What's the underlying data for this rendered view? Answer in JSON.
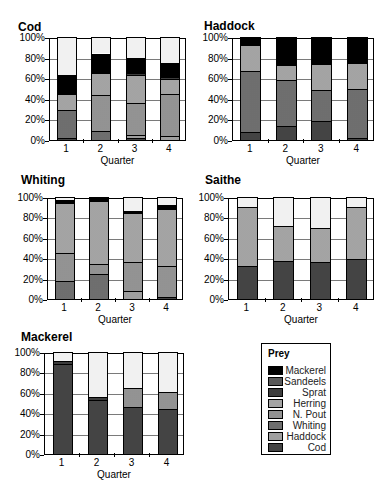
{
  "legend": {
    "title": "Prey",
    "items": [
      {
        "label": "Mackerel",
        "key": "mackerel"
      },
      {
        "label": "Sandeels",
        "key": "sandeels"
      },
      {
        "label": "Sprat",
        "key": "sprat"
      },
      {
        "label": "Herring",
        "key": "herring"
      },
      {
        "label": "N. Pout",
        "key": "npout"
      },
      {
        "label": "Whiting",
        "key": "whiting"
      },
      {
        "label": "Haddock",
        "key": "haddock"
      },
      {
        "label": "Cod",
        "key": "cod"
      }
    ]
  },
  "chart_data": [
    {
      "type": "bar",
      "stacked": true,
      "title": "Cod",
      "xlabel": "Quarter",
      "ylabel": "",
      "categories": [
        "1",
        "2",
        "3",
        "4"
      ],
      "yticks": [
        "0%",
        "20%",
        "40%",
        "60%",
        "80%",
        "100%"
      ],
      "ylim": [
        0,
        100
      ],
      "grid": true,
      "series": [
        {
          "name": "Cod",
          "values": [
            2,
            0,
            2,
            0
          ]
        },
        {
          "name": "Haddock",
          "values": [
            0,
            0,
            3,
            4
          ]
        },
        {
          "name": "Whiting",
          "values": [
            27,
            9,
            0,
            0
          ]
        },
        {
          "name": "N. Pout",
          "values": [
            0,
            35,
            31,
            41
          ]
        },
        {
          "name": "Herring",
          "values": [
            16,
            21,
            27,
            14
          ]
        },
        {
          "name": "Sprat",
          "values": [
            0,
            0,
            2,
            2
          ]
        },
        {
          "name": "Sandeels",
          "values": [
            0,
            0,
            0,
            0
          ]
        },
        {
          "name": "Mackerel",
          "values": [
            18,
            19,
            15,
            14
          ]
        },
        {
          "name": "Other",
          "values": [
            37,
            16,
            20,
            25
          ]
        }
      ]
    },
    {
      "type": "bar",
      "stacked": true,
      "title": "Haddock",
      "xlabel": "Quarter",
      "ylabel": "",
      "categories": [
        "1",
        "2",
        "3",
        "4"
      ],
      "yticks": [
        "0%",
        "20%",
        "40%",
        "60%",
        "80%",
        "100%"
      ],
      "ylim": [
        0,
        100
      ],
      "grid": true,
      "series": [
        {
          "name": "Cod",
          "values": [
            8,
            14,
            18,
            2
          ]
        },
        {
          "name": "Haddock",
          "values": [
            0,
            0,
            0,
            0
          ]
        },
        {
          "name": "Whiting",
          "values": [
            59,
            44,
            31,
            48
          ]
        },
        {
          "name": "N. Pout",
          "values": [
            0,
            0,
            0,
            0
          ]
        },
        {
          "name": "Herring",
          "values": [
            25,
            15,
            25,
            25
          ]
        },
        {
          "name": "Sprat",
          "values": [
            0,
            0,
            0,
            0
          ]
        },
        {
          "name": "Sandeels",
          "values": [
            0,
            0,
            0,
            0
          ]
        },
        {
          "name": "Mackerel",
          "values": [
            8,
            27,
            26,
            25
          ]
        }
      ]
    },
    {
      "type": "bar",
      "stacked": true,
      "title": "Whiting",
      "xlabel": "Quarter",
      "ylabel": "",
      "categories": [
        "1",
        "2",
        "3",
        "4"
      ],
      "yticks": [
        "0%",
        "20%",
        "40%",
        "60%",
        "80%",
        "100%"
      ],
      "ylim": [
        0,
        100
      ],
      "grid": true,
      "series": [
        {
          "name": "Cod",
          "values": [
            0,
            0,
            0,
            2
          ]
        },
        {
          "name": "Haddock",
          "values": [
            0,
            0,
            8,
            0
          ]
        },
        {
          "name": "Whiting",
          "values": [
            18,
            25,
            0,
            0
          ]
        },
        {
          "name": "N. Pout",
          "values": [
            27,
            9,
            28,
            30
          ]
        },
        {
          "name": "Herring",
          "values": [
            49,
            62,
            48,
            56
          ]
        },
        {
          "name": "Sprat",
          "values": [
            0,
            0,
            0,
            0
          ]
        },
        {
          "name": "Sandeels",
          "values": [
            0,
            0,
            0,
            0
          ]
        },
        {
          "name": "Mackerel",
          "values": [
            3,
            3,
            2,
            4
          ]
        },
        {
          "name": "Other",
          "values": [
            3,
            1,
            14,
            8
          ]
        }
      ]
    },
    {
      "type": "bar",
      "stacked": true,
      "title": "Saithe",
      "xlabel": "Quarter",
      "ylabel": "",
      "categories": [
        "1",
        "2",
        "3",
        "4"
      ],
      "yticks": [
        "0%",
        "20%",
        "40%",
        "60%",
        "80%",
        "100%"
      ],
      "ylim": [
        0,
        100
      ],
      "grid": true,
      "series": [
        {
          "name": "Cod",
          "values": [
            32,
            37,
            36,
            39
          ]
        },
        {
          "name": "Haddock",
          "values": [
            0,
            0,
            0,
            0
          ]
        },
        {
          "name": "Whiting",
          "values": [
            0,
            0,
            0,
            0
          ]
        },
        {
          "name": "N. Pout",
          "values": [
            0,
            0,
            0,
            0
          ]
        },
        {
          "name": "Herring",
          "values": [
            58,
            35,
            34,
            51
          ]
        },
        {
          "name": "Sprat",
          "values": [
            0,
            0,
            0,
            0
          ]
        },
        {
          "name": "Sandeels",
          "values": [
            0,
            0,
            0,
            0
          ]
        },
        {
          "name": "Mackerel",
          "values": [
            0,
            0,
            0,
            0
          ]
        },
        {
          "name": "Other",
          "values": [
            10,
            28,
            30,
            10
          ]
        }
      ]
    },
    {
      "type": "bar",
      "stacked": true,
      "title": "Mackerel",
      "xlabel": "Quarter",
      "ylabel": "",
      "categories": [
        "1",
        "2",
        "3",
        "4"
      ],
      "yticks": [
        "0%",
        "20%",
        "40%",
        "60%",
        "80%",
        "100%"
      ],
      "ylim": [
        0,
        100
      ],
      "grid": true,
      "series": [
        {
          "name": "Cod",
          "values": [
            88,
            53,
            46,
            44
          ]
        },
        {
          "name": "Haddock",
          "values": [
            0,
            0,
            0,
            0
          ]
        },
        {
          "name": "Whiting",
          "values": [
            0,
            0,
            0,
            0
          ]
        },
        {
          "name": "N. Pout",
          "values": [
            0,
            0,
            19,
            17
          ]
        },
        {
          "name": "Herring",
          "values": [
            0,
            0,
            0,
            0
          ]
        },
        {
          "name": "Sprat",
          "values": [
            3,
            3,
            0,
            0
          ]
        },
        {
          "name": "Sandeels",
          "values": [
            0,
            0,
            0,
            0
          ]
        },
        {
          "name": "Mackerel",
          "values": [
            0,
            0,
            0,
            0
          ]
        },
        {
          "name": "Other",
          "values": [
            9,
            44,
            35,
            39
          ]
        }
      ]
    }
  ],
  "panels": [
    {
      "title": "Cod",
      "xlabel": "Quarter"
    },
    {
      "title": "Haddock",
      "xlabel": "Quarter"
    },
    {
      "title": "Whiting",
      "xlabel": "Quarter"
    },
    {
      "title": "Saithe",
      "xlabel": "Quarter"
    },
    {
      "title": "Mackerel",
      "xlabel": "Quarter"
    }
  ]
}
